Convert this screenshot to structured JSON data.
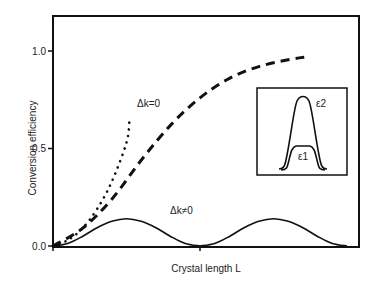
{
  "chart_data": {
    "type": "line",
    "title": "",
    "xlabel": "Crystal length L",
    "ylabel": "Conversion efficiency",
    "xlim": [
      0,
      2.08
    ],
    "ylim": [
      0,
      1.2
    ],
    "yticks": [
      {
        "value": 0.0,
        "label": "0.0"
      },
      {
        "value": 0.5,
        "label": "0.5"
      },
      {
        "value": 1.0,
        "label": "1.0"
      }
    ],
    "xticks": [
      {
        "value": 0.0,
        "label": ""
      },
      {
        "value": 1.0,
        "label": ""
      }
    ],
    "grid": false,
    "series": [
      {
        "name": "dk0-dotted",
        "style": "dotted",
        "x": [
          0,
          0.1,
          0.2,
          0.3,
          0.4,
          0.5,
          0.52
        ],
        "y": [
          0,
          0.03,
          0.09,
          0.19,
          0.33,
          0.53,
          0.64
        ]
      },
      {
        "name": "dk0-dashed",
        "style": "dashed",
        "x": [
          0,
          0.2,
          0.4,
          0.6,
          0.8,
          1.0,
          1.2,
          1.4,
          1.6,
          1.73
        ],
        "y": [
          0,
          0.09,
          0.24,
          0.44,
          0.62,
          0.76,
          0.86,
          0.92,
          0.955,
          0.97
        ]
      },
      {
        "name": "dk-nonzero",
        "style": "solid",
        "x": [
          0,
          0.1,
          0.2,
          0.3,
          0.4,
          0.5,
          0.6,
          0.7,
          0.8,
          0.9,
          1.0,
          1.1,
          1.2,
          1.3,
          1.4,
          1.5,
          1.6,
          1.7,
          1.8,
          1.9,
          2.0
        ],
        "y": [
          0,
          0.013,
          0.049,
          0.094,
          0.127,
          0.14,
          0.127,
          0.094,
          0.049,
          0.013,
          0,
          0.013,
          0.049,
          0.094,
          0.127,
          0.14,
          0.127,
          0.094,
          0.049,
          0.013,
          0
        ]
      }
    ],
    "annotations": [
      {
        "text": "Δk=0",
        "x": 0.6,
        "y": 0.7
      },
      {
        "text": "Δk≠0",
        "x": 0.82,
        "y": 0.2
      }
    ],
    "inset": {
      "labels": [
        "ε2",
        "ε1"
      ],
      "description": "pulse profiles: narrow tall peak ε2 and flat-topped low pulse ε1"
    }
  }
}
